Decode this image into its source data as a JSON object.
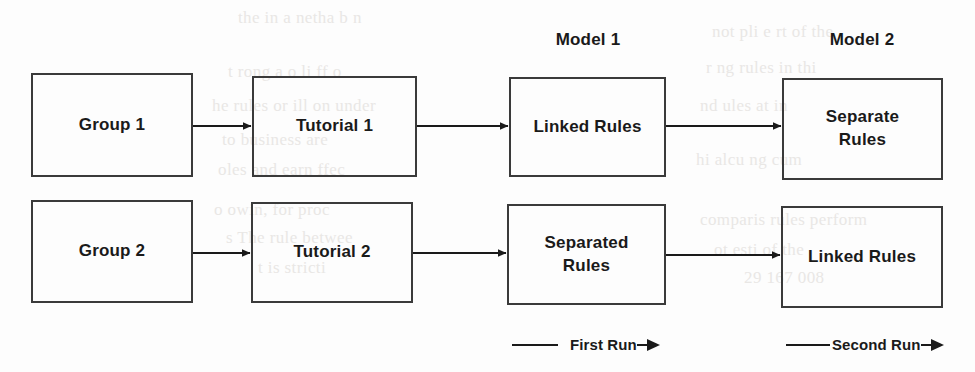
{
  "diagram": {
    "column_headers": [
      {
        "label": "Model 1",
        "x": 588,
        "y": 30
      },
      {
        "label": "Model 2",
        "x": 862,
        "y": 30
      }
    ],
    "nodes": [
      {
        "id": "group-1",
        "label": "Group 1",
        "x": 31,
        "y": 73,
        "w": 162,
        "h": 104,
        "row": 1,
        "col": 1
      },
      {
        "id": "tutorial-1",
        "label": "Tutorial 1",
        "x": 252,
        "y": 76,
        "w": 165,
        "h": 101,
        "row": 1,
        "col": 2
      },
      {
        "id": "linked-rules-1",
        "label": "Linked Rules",
        "x": 509,
        "y": 77,
        "w": 157,
        "h": 100,
        "row": 1,
        "col": 3
      },
      {
        "id": "separate-rules",
        "label": "Separate\nRules",
        "x": 782,
        "y": 78,
        "w": 161,
        "h": 102,
        "row": 1,
        "col": 4
      },
      {
        "id": "group-2",
        "label": "Group 2",
        "x": 31,
        "y": 200,
        "w": 162,
        "h": 103,
        "row": 2,
        "col": 1
      },
      {
        "id": "tutorial-2",
        "label": "Tutorial 2",
        "x": 251,
        "y": 202,
        "w": 162,
        "h": 101,
        "row": 2,
        "col": 2
      },
      {
        "id": "separated-rules",
        "label": "Separated\nRules",
        "x": 507,
        "y": 204,
        "w": 159,
        "h": 101,
        "row": 2,
        "col": 3
      },
      {
        "id": "linked-rules-2",
        "label": "Linked Rules",
        "x": 781,
        "y": 206,
        "w": 162,
        "h": 102,
        "row": 2,
        "col": 4
      }
    ],
    "connectors": [
      {
        "id": "c1",
        "from": "group-1",
        "to": "tutorial-1",
        "x1": 193,
        "y1": 126,
        "x2": 252,
        "y2": 126
      },
      {
        "id": "c2",
        "from": "tutorial-1",
        "to": "linked-rules-1",
        "x1": 417,
        "y1": 126,
        "x2": 509,
        "y2": 126
      },
      {
        "id": "c3",
        "from": "linked-rules-1",
        "to": "separate-rules",
        "x1": 666,
        "y1": 126,
        "x2": 782,
        "y2": 126
      },
      {
        "id": "c4",
        "from": "group-2",
        "to": "tutorial-2",
        "x1": 193,
        "y1": 253,
        "x2": 251,
        "y2": 253
      },
      {
        "id": "c5",
        "from": "tutorial-2",
        "to": "separated-rules",
        "x1": 413,
        "y1": 253,
        "x2": 507,
        "y2": 253
      },
      {
        "id": "c6",
        "from": "separated-rules",
        "to": "linked-rules-2",
        "x1": 666,
        "y1": 255,
        "x2": 781,
        "y2": 255
      }
    ],
    "legend": [
      {
        "id": "first-run",
        "label": "First Run",
        "x": 512,
        "y": 336,
        "line_len": 46,
        "gap_before_text": 12,
        "gap_after_text": 0
      },
      {
        "id": "second-run",
        "label": "Second Run",
        "x": 786,
        "y": 336,
        "line_len": 44,
        "gap_before_text": 2,
        "gap_after_text": 0
      }
    ],
    "style": {
      "stroke": "#3a3a3a",
      "arrow": "#1a1a1a",
      "text": "#1a1a1a",
      "background": "#fdfdfd",
      "bleed": "#e9e7e5"
    },
    "bleedthrough": [
      {
        "text": "the in  a  netha  b  n",
        "x": 238,
        "y": 8
      },
      {
        "text": "t   rong  a  o  li  ff  o",
        "x": 228,
        "y": 62
      },
      {
        "text": "he   rules  or  ill  on  under",
        "x": 212,
        "y": 96
      },
      {
        "text": "to  business  are",
        "x": 222,
        "y": 130
      },
      {
        "text": "oles  and  earn  ffec",
        "x": 218,
        "y": 160
      },
      {
        "text": "o  owin,  for  proc",
        "x": 214,
        "y": 200
      },
      {
        "text": "s  The  rule  betwee",
        "x": 226,
        "y": 228
      },
      {
        "text": "t  is  stricti",
        "x": 258,
        "y": 258
      },
      {
        "text": "not  pli  e  rt  of  the",
        "x": 712,
        "y": 22
      },
      {
        "text": "r  ng  rules  in  thi",
        "x": 706,
        "y": 58
      },
      {
        "text": "nd  ules  at  in",
        "x": 700,
        "y": 96
      },
      {
        "text": "hi  alcu  ng  cum",
        "x": 696,
        "y": 150
      },
      {
        "text": "comparis  rules  perform",
        "x": 700,
        "y": 210
      },
      {
        "text": "ot  esti  of  the",
        "x": 714,
        "y": 240
      },
      {
        "text": "29    167   008",
        "x": 744,
        "y": 268
      }
    ]
  }
}
